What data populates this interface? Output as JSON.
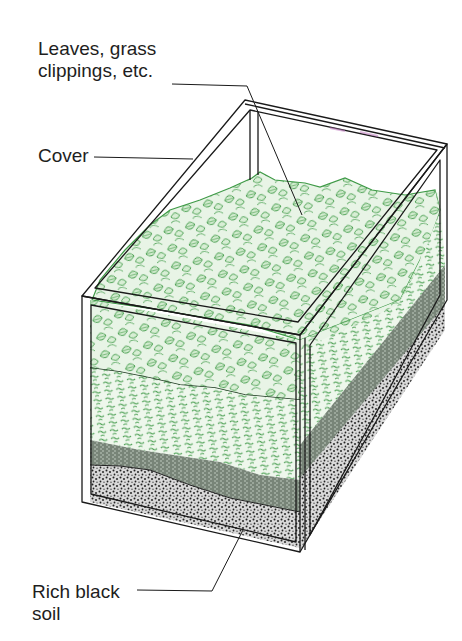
{
  "figure": {
    "labels": {
      "leaves_line1": "Leaves, grass",
      "leaves_line2": "clippings, etc.",
      "cover": "Cover",
      "soil_line1": "Rich black",
      "soil_line2": "soil"
    },
    "layers": [
      {
        "name": "leaves-grass-clippings",
        "color": "#3f9a47"
      },
      {
        "name": "shredded-bedding",
        "color": "#5aa860"
      },
      {
        "name": "mixed-dark-layer",
        "color": "#6f7d6f"
      },
      {
        "name": "rich-black-soil",
        "color": "#2a2a2a"
      }
    ],
    "colors": {
      "frame": "#1a1a1a",
      "leaf_green": "#3f9a47",
      "leaf_fill": "#e6f3e4",
      "label_text": "#1e1e1e"
    }
  }
}
